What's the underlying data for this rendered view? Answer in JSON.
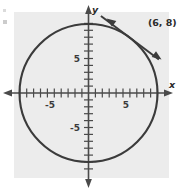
{
  "figure": {
    "panel": {
      "background_color": "#ececec",
      "x": 14,
      "y": 12,
      "width": 155,
      "height": 166
    },
    "page_background_color": "#ffffff",
    "stroke_color": "#3b3b3b",
    "axis_color": "#4a4a4a"
  },
  "axes": {
    "x_axis_label": "x",
    "y_axis_label": "y",
    "origin_px": {
      "x": 88.5,
      "y": 93
    },
    "unit_px": 6.9,
    "x_range": [
      -11.5,
      10.5
    ],
    "y_range": [
      -12.5,
      12.0
    ],
    "tick_interval": 1,
    "grid": false,
    "x_tick_labels": [
      {
        "value": -5,
        "text": "-5"
      },
      {
        "value": 5,
        "text": "5"
      }
    ],
    "y_tick_labels": [
      {
        "value": 5,
        "text": "5"
      },
      {
        "value": -5,
        "text": "-5"
      }
    ]
  },
  "chart_data": {
    "type": "scatter",
    "title": "",
    "xlabel": "x",
    "ylabel": "y",
    "xlim": [
      -11.5,
      10.5
    ],
    "ylim": [
      -12.5,
      12.0
    ],
    "grid": false,
    "shapes": [
      {
        "kind": "circle",
        "center": [
          0,
          0
        ],
        "radius": 10,
        "equation": "x^2 + y^2 = 100",
        "filled": false
      },
      {
        "kind": "line",
        "role": "tangent",
        "through_point": [
          6,
          8
        ],
        "slope": -0.75,
        "equation": "y - 8 = -0.75(x - 6)",
        "double_arrow": true
      }
    ],
    "annotations": [
      {
        "text": "(6, 8)",
        "point": [
          6,
          8
        ],
        "label_offset_px": [
          18,
          -12
        ]
      }
    ]
  },
  "labels": {
    "tangent_point": "(6, 8)"
  }
}
